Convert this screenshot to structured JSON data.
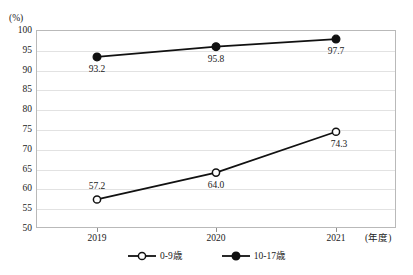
{
  "chart_data": {
    "type": "line",
    "title": "",
    "categories": [
      "2019",
      "2020",
      "2021"
    ],
    "xlabel": "(年度)",
    "ylabel": "(%)",
    "ylim": [
      50,
      100
    ],
    "yticks": [
      50,
      55,
      60,
      65,
      70,
      75,
      80,
      85,
      90,
      95,
      100
    ],
    "ytick_labels": [
      "50",
      "55",
      "60",
      "65",
      "70",
      "75",
      "80",
      "85",
      "90",
      "95",
      "100"
    ],
    "grid": true,
    "legend_position": "bottom",
    "series": [
      {
        "name": "0-9歳",
        "marker": "open-circle",
        "color": "#111111",
        "values": [
          57.2,
          64.0,
          74.3
        ],
        "value_labels": [
          "57.2",
          "64.0",
          "74.3"
        ],
        "label_offsets": [
          {
            "dx": 0,
            "dy": -12
          },
          {
            "dx": 0,
            "dy": 13
          },
          {
            "dx": 3,
            "dy": 13
          }
        ]
      },
      {
        "name": "10-17歳",
        "marker": "filled-circle",
        "color": "#111111",
        "values": [
          93.2,
          95.8,
          97.7
        ],
        "value_labels": [
          "93.2",
          "95.8",
          "97.7"
        ],
        "label_offsets": [
          {
            "dx": 0,
            "dy": 13
          },
          {
            "dx": 0,
            "dy": 13
          },
          {
            "dx": 0,
            "dy": 13
          }
        ]
      }
    ]
  },
  "legend": {
    "items": [
      {
        "label": "0-9歳",
        "marker": "open-circle"
      },
      {
        "label": "10-17歳",
        "marker": "filled-circle"
      }
    ]
  },
  "axes": {
    "y_unit": "(%)",
    "x_unit": "(年度)"
  }
}
